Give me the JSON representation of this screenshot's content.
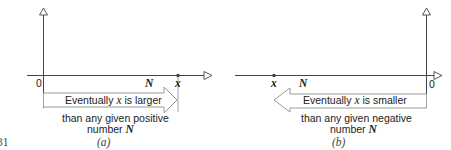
{
  "figure_number": "31",
  "panels": [
    {
      "id": "a",
      "caption": "(a)",
      "origin_label": "0",
      "n_label": "N",
      "x_label": "x",
      "arrow_text_prefix": "Eventually ",
      "arrow_text_var": "x",
      "arrow_text_suffix": " is larger",
      "below_line1": "than any given positive",
      "below_line2_prefix": "number ",
      "below_line2_var": "N"
    },
    {
      "id": "b",
      "caption": "(b)",
      "origin_label": "0",
      "n_label": "N",
      "x_label": "x",
      "arrow_text_prefix": "Eventually ",
      "arrow_text_var": "x",
      "arrow_text_suffix": " is smaller",
      "below_line1": "than any given negative",
      "below_line2_prefix": "number ",
      "below_line2_var": "N"
    }
  ],
  "colors": {
    "axis": "#444444",
    "arrow_outline": "#9a9a9a",
    "text": "#222222"
  }
}
